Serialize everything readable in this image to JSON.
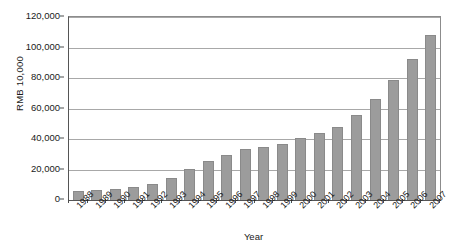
{
  "chart_data": {
    "type": "bar",
    "title": "",
    "xlabel": "Year",
    "ylabel": "RMB 10,000",
    "categories": [
      "1988",
      "1989",
      "1990",
      "1991",
      "1992",
      "1993",
      "1994",
      "1995",
      "1996",
      "1997",
      "1998",
      "1999",
      "2000",
      "2001",
      "2002",
      "2003",
      "2004",
      "2005",
      "2006",
      "2007"
    ],
    "values": [
      6000,
      6600,
      7000,
      8300,
      10600,
      14700,
      20400,
      25500,
      29700,
      33400,
      34600,
      37000,
      40800,
      44200,
      48000,
      56000,
      66200,
      78500,
      92700,
      108500
    ],
    "series": [
      {
        "name": "Total",
        "values": [
          6000,
          6600,
          7000,
          8300,
          10600,
          14700,
          20400,
          25500,
          29700,
          33400,
          34600,
          37000,
          40800,
          44200,
          48000,
          56000,
          66200,
          78500,
          92700,
          108500
        ]
      }
    ],
    "ylim": [
      0,
      120000
    ],
    "yticks": [
      0,
      20000,
      40000,
      60000,
      80000,
      100000,
      120000
    ],
    "ytick_labels": [
      "0",
      "20,000",
      "40,000",
      "60,000",
      "80,000",
      "100,000",
      "120,000"
    ],
    "grid": true,
    "grid_axis": "y",
    "legend": false,
    "legend_position": "none",
    "bar_color": "#9c9c9c",
    "bar_edge_color": "#8a8a8a",
    "grid_color": "#a8a8a8",
    "axis_color": "#555555",
    "background_color": "#ffffff"
  }
}
